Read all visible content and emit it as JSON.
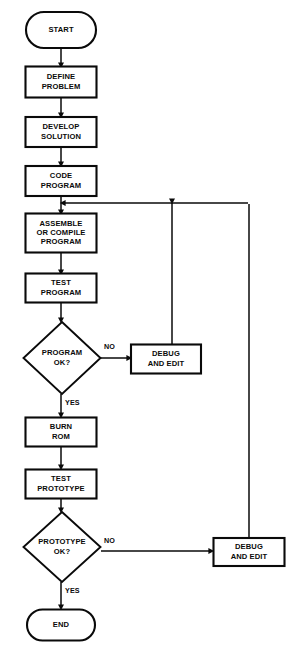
{
  "diagram": {
    "type": "flowchart",
    "background_color": "#ffffff",
    "line_color": "#0a0a0a",
    "width": 299,
    "height": 665
  },
  "nodes": [
    {
      "id": "start",
      "shape": "terminal",
      "label_lines": [
        "START"
      ],
      "cx": 61,
      "cy": 30,
      "w": 70,
      "h": 36
    },
    {
      "id": "define",
      "shape": "process",
      "label_lines": [
        "DEFINE",
        "PROBLEM"
      ],
      "cx": 61,
      "cy": 82,
      "w": 71,
      "h": 31
    },
    {
      "id": "develop",
      "shape": "process",
      "label_lines": [
        "DEVELOP",
        "SOLUTION"
      ],
      "cx": 61,
      "cy": 132,
      "w": 71,
      "h": 30
    },
    {
      "id": "code",
      "shape": "process",
      "label_lines": [
        "CODE",
        "PROGRAM"
      ],
      "cx": 61,
      "cy": 181,
      "w": 71,
      "h": 30
    },
    {
      "id": "assemble",
      "shape": "process",
      "label_lines": [
        "ASSEMBLE",
        "OR COMPILE",
        "PROGRAM"
      ],
      "cx": 61,
      "cy": 233,
      "w": 71,
      "h": 39
    },
    {
      "id": "testprog",
      "shape": "process",
      "label_lines": [
        "TEST",
        "PROGRAM"
      ],
      "cx": 61,
      "cy": 288,
      "w": 71,
      "h": 29
    },
    {
      "id": "progok",
      "shape": "decision",
      "label_lines": [
        "PROGRAM",
        "OK?"
      ],
      "cx": 62,
      "cy": 358,
      "w": 77,
      "h": 72
    },
    {
      "id": "debug1",
      "shape": "process",
      "label_lines": [
        "DEBUG",
        "AND EDIT"
      ],
      "cx": 166,
      "cy": 359,
      "w": 70,
      "h": 29
    },
    {
      "id": "burn",
      "shape": "process",
      "label_lines": [
        "BURN",
        "ROM"
      ],
      "cx": 61,
      "cy": 432,
      "w": 71,
      "h": 29
    },
    {
      "id": "testproto",
      "shape": "process",
      "label_lines": [
        "TEST",
        "PROTOTYPE"
      ],
      "cx": 61,
      "cy": 484,
      "w": 71,
      "h": 29
    },
    {
      "id": "protook",
      "shape": "decision",
      "label_lines": [
        "PROTOTYPE",
        "OK?"
      ],
      "cx": 62,
      "cy": 547,
      "w": 77,
      "h": 70
    },
    {
      "id": "debug2",
      "shape": "process",
      "label_lines": [
        "DEBUG",
        "AND EDIT"
      ],
      "cx": 249,
      "cy": 552,
      "w": 71,
      "h": 28
    },
    {
      "id": "end",
      "shape": "terminal",
      "label_lines": [
        "END"
      ],
      "cx": 61,
      "cy": 625,
      "w": 68,
      "h": 31
    }
  ],
  "edges": [
    {
      "id": "start-define",
      "from": "start",
      "to": "define",
      "label": "",
      "path": "M 61 48 L 61 65",
      "arrow": {
        "x": 61,
        "y": 67,
        "dir": "down"
      }
    },
    {
      "id": "define-develop",
      "from": "define",
      "to": "develop",
      "label": "",
      "path": "M 61 98 L 61 115",
      "arrow": {
        "x": 61,
        "y": 117,
        "dir": "down"
      }
    },
    {
      "id": "develop-code",
      "from": "develop",
      "to": "code",
      "label": "",
      "path": "M 61 147 L 61 164",
      "arrow": {
        "x": 61,
        "y": 166,
        "dir": "down"
      }
    },
    {
      "id": "code-assemble",
      "from": "code",
      "to": "assemble",
      "label": "",
      "path": "M 61 196 L 61 212",
      "arrow": {
        "x": 61,
        "y": 214,
        "dir": "down"
      }
    },
    {
      "id": "assemble-testprog",
      "from": "assemble",
      "to": "testprog",
      "label": "",
      "path": "M 61 253 L 61 272",
      "arrow": {
        "x": 61,
        "y": 274,
        "dir": "down"
      }
    },
    {
      "id": "testprog-progok",
      "from": "testprog",
      "to": "progok",
      "label": "",
      "path": "M 61 303 L 61 320",
      "arrow": {
        "x": 61,
        "y": 322,
        "dir": "down"
      }
    },
    {
      "id": "progok-debug1",
      "from": "progok",
      "to": "debug1",
      "label": "NO",
      "path": "M 101 358 L 129 358",
      "arrow": {
        "x": 131,
        "y": 358,
        "dir": "right"
      },
      "label_pos": {
        "x": 104,
        "y": 347
      }
    },
    {
      "id": "debug1-loop",
      "from": "debug1",
      "to": "assemble",
      "label": "",
      "path": "M 172 345 L 172 203",
      "arrow": {
        "x": 172,
        "y": 203,
        "dir": "downjoin"
      }
    },
    {
      "id": "loop-join",
      "from": "debug1",
      "to": "assemble",
      "label": "",
      "path": "M 248 203 L 63 203",
      "arrow": {
        "x": 61,
        "y": 203,
        "dir": "left"
      }
    },
    {
      "id": "progok-burn",
      "from": "progok",
      "to": "burn",
      "label": "YES",
      "path": "M 61 394 L 61 415",
      "arrow": {
        "x": 61,
        "y": 417,
        "dir": "down"
      },
      "label_pos": {
        "x": 65,
        "y": 403
      }
    },
    {
      "id": "burn-testproto",
      "from": "burn",
      "to": "testproto",
      "label": "",
      "path": "M 61 447 L 61 467",
      "arrow": {
        "x": 61,
        "y": 469,
        "dir": "down"
      }
    },
    {
      "id": "testproto-protook",
      "from": "testproto",
      "to": "protook",
      "label": "",
      "path": "M 61 499 L 61 510",
      "arrow": {
        "x": 61,
        "y": 512,
        "dir": "down"
      }
    },
    {
      "id": "protook-debug2",
      "from": "protook",
      "to": "debug2",
      "label": "NO",
      "path": "M 101 551 L 211 551",
      "arrow": {
        "x": 213,
        "y": 551,
        "dir": "right"
      },
      "label_pos": {
        "x": 104,
        "y": 541
      }
    },
    {
      "id": "debug2-loop",
      "from": "debug2",
      "to": "assemble",
      "label": "",
      "path": "M 249 538 L 249 204",
      "arrow": null
    },
    {
      "id": "protook-end",
      "from": "protook",
      "to": "end",
      "label": "YES",
      "path": "M 61 582 L 61 607",
      "arrow": {
        "x": 61,
        "y": 609,
        "dir": "down"
      },
      "label_pos": {
        "x": 65,
        "y": 591
      }
    }
  ],
  "edge_labels": [
    {
      "id": "no-1",
      "text": "NO",
      "x": 104,
      "y": 347
    },
    {
      "id": "yes-1",
      "text": "YES",
      "x": 65,
      "y": 403
    },
    {
      "id": "no-2",
      "text": "NO",
      "x": 104,
      "y": 541
    },
    {
      "id": "yes-2",
      "text": "YES",
      "x": 65,
      "y": 591
    }
  ]
}
